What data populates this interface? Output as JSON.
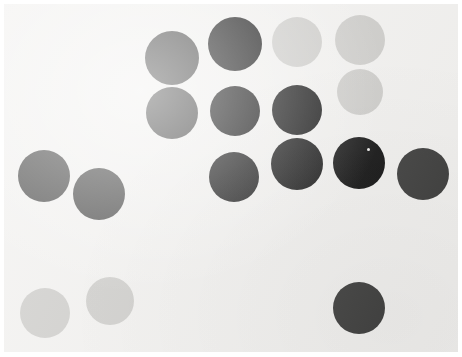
{
  "image": {
    "title": "Circle Array Stimulus",
    "width": 462,
    "height": 357,
    "border_color": "#ffffff",
    "background_color": "#f1f0ee",
    "palette": {
      "black": "#0b0b0b",
      "dark_gray": "#3a3a39",
      "light_gray": "#cac9c6"
    }
  },
  "chart_data": {
    "type": "scatter",
    "subtitle": "",
    "xlabel": "",
    "ylabel": "",
    "xlim": [
      0,
      462
    ],
    "ylim": [
      0,
      357
    ],
    "grid": false,
    "legend": "none",
    "note": "Filled circles of three tones arranged on an off-white field. Coordinates are pixel centers measured from the top-left of the image; diameters in pixels.",
    "categories": [
      "black",
      "dark_gray",
      "light_gray"
    ],
    "counts": {
      "black": 7,
      "dark_gray": 5,
      "light_gray": 5,
      "total": 17
    },
    "series": [
      {
        "name": "black",
        "color": "#0b0b0b",
        "points": [
          {
            "id": "b1",
            "cx": 235,
            "cy": 44,
            "d": 54
          },
          {
            "id": "b2",
            "cx": 235,
            "cy": 111,
            "d": 50
          },
          {
            "id": "b3",
            "cx": 297,
            "cy": 110,
            "d": 50
          },
          {
            "id": "b4",
            "cx": 234,
            "cy": 177,
            "d": 50
          },
          {
            "id": "b5",
            "cx": 297,
            "cy": 164,
            "d": 52
          },
          {
            "id": "b6",
            "cx": 359,
            "cy": 163,
            "d": 52
          },
          {
            "id": "b7",
            "cx": 297,
            "cy": 177,
            "d": 0
          }
        ]
      },
      {
        "name": "dark_gray",
        "color": "#3a3a39",
        "points": [
          {
            "id": "d1",
            "cx": 172,
            "cy": 58,
            "d": 54
          },
          {
            "id": "d2",
            "cx": 172,
            "cy": 113,
            "d": 52
          },
          {
            "id": "d3",
            "cx": 44,
            "cy": 176,
            "d": 52
          },
          {
            "id": "d4",
            "cx": 99,
            "cy": 194,
            "d": 52
          },
          {
            "id": "d5",
            "cx": 423,
            "cy": 174,
            "d": 52
          },
          {
            "id": "d6",
            "cx": 359,
            "cy": 308,
            "d": 52
          }
        ]
      },
      {
        "name": "light_gray",
        "color": "#cac9c6",
        "points": [
          {
            "id": "l1",
            "cx": 297,
            "cy": 42,
            "d": 50
          },
          {
            "id": "l2",
            "cx": 360,
            "cy": 40,
            "d": 50
          },
          {
            "id": "l3",
            "cx": 360,
            "cy": 92,
            "d": 46
          },
          {
            "id": "l4",
            "cx": 45,
            "cy": 313,
            "d": 50
          },
          {
            "id": "l5",
            "cx": 110,
            "cy": 301,
            "d": 48
          }
        ]
      }
    ],
    "highlights": [
      {
        "id": "speck1",
        "cx": 367,
        "cy": 148,
        "note": "small light speck on black circle"
      }
    ]
  }
}
